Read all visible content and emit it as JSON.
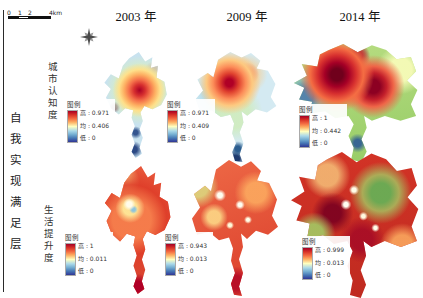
{
  "figure": {
    "side_label": "自我实现满足层",
    "row_labels": [
      "城市认知度",
      "生活提升度"
    ],
    "column_titles": [
      "2003 年",
      "2009 年",
      "2014 年"
    ],
    "scale_bar": {
      "labels": [
        "0",
        "1",
        "2",
        "4km"
      ]
    },
    "compass_icon": "north-compass-rose",
    "legend_ramp_colors": {
      "high": "#a50026",
      "mid": "#ffffbf",
      "low": "#313695"
    },
    "maps": [
      {
        "id": "cognition-2003",
        "row": "城市认知度",
        "year": "2003 年",
        "legend": {
          "title": "图例",
          "high": "高 : 0.971",
          "mean": "均 : 0.406",
          "low": "低 : 0"
        }
      },
      {
        "id": "cognition-2009",
        "row": "城市认知度",
        "year": "2009 年",
        "legend": {
          "title": "图例",
          "high": "高 : 0.971",
          "mean": "均 : 0.409",
          "low": "低 : 0"
        }
      },
      {
        "id": "cognition-2014",
        "row": "城市认知度",
        "year": "2014 年",
        "legend": {
          "title": "图例",
          "high": "高 : 1",
          "mean": "均 : 0.442",
          "low": "低 : 0"
        }
      },
      {
        "id": "life-2003",
        "row": "生活提升度",
        "year": "2003 年",
        "legend": {
          "title": "图例",
          "high": "高 : 1",
          "mean": "均 : 0.011",
          "low": "低 : 0"
        }
      },
      {
        "id": "life-2009",
        "row": "生活提升度",
        "year": "2009 年",
        "legend": {
          "title": "图例",
          "high": "高 : 0.943",
          "mean": "均 : 0.013",
          "low": "低 : 0"
        }
      },
      {
        "id": "life-2014",
        "row": "生活提升度",
        "year": "2014 年",
        "legend": {
          "title": "图例",
          "high": "高 : 0.999",
          "mean": "均 : 0.013",
          "low": "低 : 0"
        }
      }
    ]
  }
}
